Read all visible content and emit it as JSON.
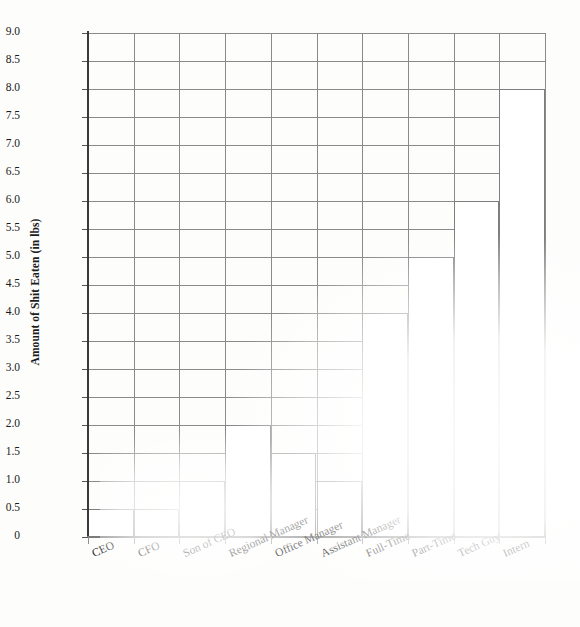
{
  "chart_data": {
    "type": "bar",
    "title": "",
    "xlabel": "",
    "ylabel": "Amount of Shit Eaten (in lbs)",
    "categories": [
      "CEO",
      "CFO",
      "Son of CEO",
      "Regional Manager",
      "Office Manager",
      "Assistant Manager",
      "Full-Time",
      "Part-Time",
      "Tech Guy",
      "Intern"
    ],
    "values": [
      0.5,
      0.5,
      1.0,
      2.0,
      1.5,
      1.0,
      4.0,
      5.0,
      6.0,
      8.0
    ],
    "ylim": [
      0,
      9
    ],
    "ytick_labels": [
      "9.0",
      "8.5",
      "8.0",
      "7.5",
      "7.0",
      "6.5",
      "6.0",
      "5.5",
      "5.0",
      "4.5",
      "4.0",
      "3.5",
      "3.0",
      "2.5",
      "2.0",
      "1.5",
      "1.0",
      "0.5",
      "0"
    ],
    "ytick_values": [
      9.0,
      8.5,
      8.0,
      7.5,
      7.0,
      6.5,
      6.0,
      5.5,
      5.0,
      4.5,
      4.0,
      3.5,
      3.0,
      2.5,
      2.0,
      1.5,
      1.0,
      0.5,
      0
    ],
    "grid": true,
    "legend": "none",
    "bar_fill_color": "#ffffff",
    "bar_outline_color": "#7e7e7e",
    "gridline_color": "#8a8a8a",
    "axis_color": "#3a3a3a",
    "background_color": "#fdfdfc",
    "text_color": "#1a1a1a"
  }
}
